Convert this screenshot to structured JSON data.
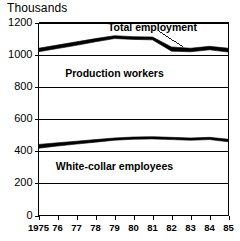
{
  "chart_data": {
    "type": "area",
    "title": "Thousands",
    "xlabel": "",
    "ylabel": "Thousands",
    "ylim": [
      0,
      1200
    ],
    "xlim": [
      1975,
      1985
    ],
    "yticks": [
      0,
      200,
      400,
      600,
      800,
      1000,
      1200
    ],
    "ytick_labels": [
      "0",
      "200",
      "400",
      "600",
      "800",
      "1000",
      "1200"
    ],
    "x": [
      1975,
      1976,
      1977,
      1978,
      1979,
      1980,
      1981,
      1982,
      1983,
      1984,
      1985
    ],
    "xtick_labels": [
      "1975",
      "76",
      "77",
      "78",
      "79",
      "80",
      "81",
      "82",
      "83",
      "84",
      "85"
    ],
    "grid": true,
    "legend_position": "inline-annotations",
    "series": [
      {
        "name": "Total employment",
        "role": "upper-band",
        "upper_values": [
          1040,
          1060,
          1080,
          1100,
          1118,
          1112,
          1110,
          1048,
          1040,
          1052,
          1040
        ],
        "lower_values": [
          1018,
          1038,
          1058,
          1080,
          1100,
          1095,
          1092,
          1022,
          1018,
          1030,
          1016
        ]
      },
      {
        "name": "White-collar employees",
        "role": "lower-band",
        "upper_values": [
          442,
          452,
          462,
          472,
          482,
          488,
          490,
          486,
          482,
          486,
          474
        ],
        "lower_values": [
          418,
          432,
          444,
          456,
          468,
          474,
          476,
          472,
          468,
          472,
          458
        ]
      }
    ],
    "annotations": [
      {
        "text": "Total employment",
        "x": 1981.0,
        "y": 1168,
        "leader_to_x": 1982.6,
        "leader_to_y": 1045
      },
      {
        "text": "Production workers",
        "x": 1979.0,
        "y": 880
      },
      {
        "text": "White-collar employees",
        "x": 1979.0,
        "y": 300
      }
    ],
    "colors": {
      "band": "#000000",
      "grid": "#000000",
      "axis": "#000000",
      "background": "#ffffff",
      "text": "#000000"
    }
  }
}
